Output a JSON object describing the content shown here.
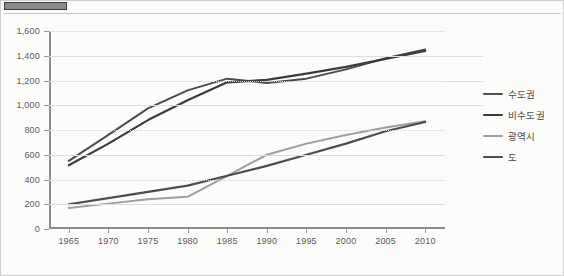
{
  "document": {
    "top_tab_name": "header-tab-fragment"
  },
  "chart_data": {
    "type": "line",
    "title": "",
    "xlabel": "",
    "ylabel": "",
    "x": [
      1965,
      1970,
      1975,
      1980,
      1985,
      1990,
      1995,
      2000,
      2005,
      2010
    ],
    "xtick_labels": [
      "1965",
      "1970",
      "1975",
      "1980",
      "1985",
      "1990",
      "1995",
      "2000",
      "2005",
      "2010"
    ],
    "ytick_labels": [
      "0",
      "200",
      "400",
      "600",
      "800",
      "1,000",
      "1,200",
      "1,400",
      "1,600"
    ],
    "yticks": [
      0,
      200,
      400,
      600,
      800,
      1000,
      1200,
      1400,
      1600
    ],
    "ylim": [
      0,
      1600
    ],
    "xlim": [
      1962.5,
      2012.5
    ],
    "grid": true,
    "legend_position": "right",
    "series": [
      {
        "name": "수도권",
        "color": "#4d4d4d",
        "width": 2.0,
        "values": [
          550,
          760,
          975,
          1120,
          1215,
          1180,
          1215,
          1290,
          1380,
          1450
        ]
      },
      {
        "name": "비수도권",
        "color": "#3c3c3c",
        "width": 2.2,
        "values": [
          515,
          690,
          880,
          1040,
          1185,
          1205,
          1255,
          1310,
          1375,
          1440
        ]
      },
      {
        "name": "광역시",
        "color": "#9e9e9e",
        "width": 2.0,
        "values": [
          170,
          205,
          240,
          260,
          430,
          600,
          690,
          760,
          820,
          870
        ]
      },
      {
        "name": "도",
        "color": "#4d4d4d",
        "width": 2.2,
        "values": [
          200,
          250,
          300,
          350,
          430,
          510,
          600,
          690,
          790,
          865
        ]
      }
    ]
  }
}
